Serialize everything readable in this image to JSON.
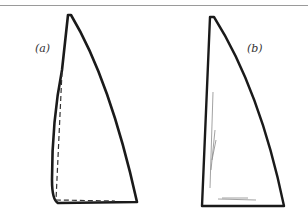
{
  "figure": {
    "panels": [
      {
        "id": "a",
        "label": "(a)",
        "description": "sail outline with dashed straight-luff reference"
      },
      {
        "id": "b",
        "label": "(b)",
        "description": "sail outline with light pencil shading"
      }
    ],
    "colors": {
      "stroke": "#1a1a1a",
      "rule": "#9a9a9a",
      "shading": "#8a8a8a"
    }
  }
}
